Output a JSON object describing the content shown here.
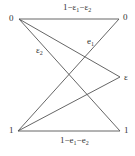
{
  "diagram": {
    "nodes": {
      "top_left": "0",
      "top_right": "0",
      "mid_right": "ε",
      "bottom_left": "1",
      "bottom_right": "1"
    },
    "edge_labels": {
      "top": {
        "base": "1−ε",
        "s1": "1",
        "mid": "−ε",
        "s2": "2"
      },
      "bottom": {
        "base": "1−e",
        "s1": "1",
        "mid": "−e",
        "s2": "2"
      },
      "e1": {
        "base": "e",
        "sub": "1"
      },
      "eps2": {
        "base": "ε",
        "sub": "2"
      }
    },
    "line_color": "#555555"
  }
}
